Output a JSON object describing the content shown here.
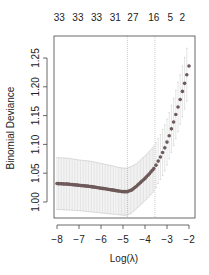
{
  "chart_data": {
    "type": "scatter",
    "title": "",
    "xlabel": "Log(λ)",
    "ylabel": "Binomial Deviance",
    "xlim": [
      -8.0,
      -2.0
    ],
    "ylim": [
      0.975,
      1.29
    ],
    "x_ticks": [
      -8,
      -7,
      -6,
      -5,
      -4,
      -3,
      -2
    ],
    "x_tick_labels": [
      "−8",
      "−7",
      "−6",
      "−5",
      "−4",
      "−3",
      "−2"
    ],
    "y_ticks": [
      1.0,
      1.05,
      1.1,
      1.15,
      1.2,
      1.25
    ],
    "y_tick_labels": [
      "1.00",
      "1.05",
      "1.10",
      "1.15",
      "1.20",
      "1.25"
    ],
    "top_axis": {
      "labels": [
        "33",
        "33",
        "33",
        "31",
        "27",
        "16",
        "5",
        "2"
      ],
      "positions": [
        -7.9,
        -7.05,
        -6.2,
        -5.35,
        -4.55,
        -3.6,
        -2.85,
        -2.3
      ]
    },
    "vlines": [
      {
        "name": "lambda.min",
        "x": -4.8
      },
      {
        "name": "lambda.1se",
        "x": -3.55
      }
    ],
    "grid": false,
    "series": [
      {
        "name": "cv-mean",
        "x": [
          -8.0,
          -7.5,
          -7.0,
          -6.5,
          -6.0,
          -5.5,
          -5.2,
          -5.0,
          -4.8,
          -4.6,
          -4.4,
          -4.2,
          -4.0,
          -3.8,
          -3.6,
          -3.5,
          -3.4,
          -3.3,
          -3.2,
          -3.1,
          -3.0,
          -2.9,
          -2.8,
          -2.7,
          -2.6,
          -2.5,
          -2.4,
          -2.3,
          -2.2,
          -2.1,
          -2.0
        ],
        "y": [
          1.032,
          1.031,
          1.029,
          1.027,
          1.024,
          1.021,
          1.019,
          1.018,
          1.018,
          1.021,
          1.027,
          1.034,
          1.041,
          1.049,
          1.058,
          1.064,
          1.071,
          1.078,
          1.086,
          1.094,
          1.104,
          1.115,
          1.127,
          1.139,
          1.152,
          1.165,
          1.178,
          1.192,
          1.206,
          1.221,
          1.236
        ],
        "lower": [
          0.987,
          0.986,
          0.985,
          0.983,
          0.981,
          0.979,
          0.978,
          0.977,
          0.977,
          0.981,
          0.988,
          0.995,
          1.002,
          1.01,
          1.019,
          1.025,
          1.032,
          1.039,
          1.046,
          1.054,
          1.064,
          1.075,
          1.086,
          1.098,
          1.11,
          1.122,
          1.135,
          1.148,
          1.161,
          1.175,
          1.19
        ],
        "upper": [
          1.077,
          1.076,
          1.073,
          1.071,
          1.067,
          1.063,
          1.06,
          1.059,
          1.059,
          1.062,
          1.066,
          1.073,
          1.08,
          1.088,
          1.097,
          1.103,
          1.11,
          1.117,
          1.126,
          1.134,
          1.144,
          1.155,
          1.168,
          1.18,
          1.194,
          1.208,
          1.221,
          1.236,
          1.251,
          1.267,
          1.282
        ]
      }
    ]
  }
}
